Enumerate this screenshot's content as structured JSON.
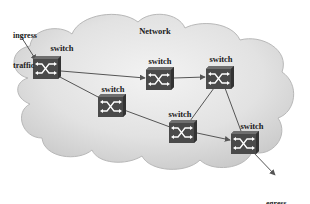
{
  "diagram": {
    "title": "Network",
    "colors": {
      "background": "#ffffff",
      "cloud_fill_light": "#f0f0f0",
      "cloud_fill_dark": "#cfcfcf",
      "cloud_stroke": "#b5b5b5",
      "switch_fill": "#4a4a4a",
      "switch_top": "#6a6a6a",
      "switch_glyph": "#ffffff",
      "link": "#555555",
      "text": "#1a1a1a"
    },
    "ingress": {
      "label_line1": "ingress",
      "label_line2": "traffic"
    },
    "egress": {
      "label_line1": "egress",
      "label_line2": "traffic"
    },
    "switches": [
      {
        "id": "s1",
        "label": "switch",
        "x": 47,
        "y": 67,
        "role": "ingress"
      },
      {
        "id": "s2",
        "label": "switch",
        "x": 112,
        "y": 105
      },
      {
        "id": "s3",
        "label": "switch",
        "x": 160,
        "y": 78
      },
      {
        "id": "s4",
        "label": "switch",
        "x": 220,
        "y": 77
      },
      {
        "id": "s5",
        "label": "switch",
        "x": 183,
        "y": 131
      },
      {
        "id": "s6",
        "label": "switch",
        "x": 245,
        "y": 142,
        "role": "egress"
      }
    ],
    "links": [
      {
        "from": "s1",
        "to": "s3",
        "arrow": true
      },
      {
        "from": "s1",
        "to": "s2",
        "arrow": false
      },
      {
        "from": "s2",
        "to": "s5",
        "arrow": false
      },
      {
        "from": "s3",
        "to": "s4",
        "arrow": true
      },
      {
        "from": "s4",
        "to": "s5",
        "arrow": false
      },
      {
        "from": "s4",
        "to": "s6",
        "arrow": false
      },
      {
        "from": "s5",
        "to": "s6",
        "arrow": true
      }
    ],
    "icons": {
      "switch_icon": "crossed-arrows-switch",
      "cloud_icon": "network-cloud"
    }
  }
}
